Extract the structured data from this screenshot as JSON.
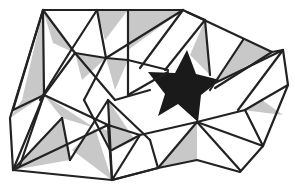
{
  "figure": {
    "title": "",
    "colors": {
      "background": "#ffffff",
      "edge": "#222222",
      "shaded": "#c8c8c8",
      "star": "#1a1a1a"
    },
    "outline": [
      [
        43,
        10
      ],
      [
        128,
        10
      ],
      [
        183,
        10
      ],
      [
        187,
        12
      ],
      [
        272,
        52
      ],
      [
        283,
        50
      ],
      [
        288,
        85
      ],
      [
        263,
        146
      ],
      [
        240,
        172
      ],
      [
        197,
        160
      ],
      [
        158,
        168
      ],
      [
        112,
        180
      ],
      [
        13,
        170
      ],
      [
        10,
        118
      ],
      [
        43,
        10
      ]
    ],
    "shaded_triangles": [
      [
        [
          43,
          10
        ],
        [
          53,
          43
        ],
        [
          75,
          53
        ]
      ],
      [
        [
          43,
          10
        ],
        [
          22,
          100
        ],
        [
          44,
          95
        ]
      ],
      [
        [
          97,
          10
        ],
        [
          128,
          10
        ],
        [
          105,
          40
        ]
      ],
      [
        [
          128,
          10
        ],
        [
          183,
          10
        ],
        [
          128,
          50
        ]
      ],
      [
        [
          75,
          53
        ],
        [
          106,
          58
        ],
        [
          82,
          80
        ]
      ],
      [
        [
          44,
          95
        ],
        [
          22,
          100
        ],
        [
          10,
          118
        ]
      ],
      [
        [
          44,
          95
        ],
        [
          95,
          128
        ],
        [
          62,
          118
        ]
      ],
      [
        [
          62,
          118
        ],
        [
          13,
          170
        ],
        [
          70,
          160
        ]
      ],
      [
        [
          95,
          128
        ],
        [
          112,
          180
        ],
        [
          72,
          150
        ]
      ],
      [
        [
          108,
          100
        ],
        [
          110,
          150
        ],
        [
          135,
          140
        ]
      ],
      [
        [
          128,
          60
        ],
        [
          106,
          58
        ],
        [
          115,
          90
        ]
      ],
      [
        [
          205,
          20
        ],
        [
          210,
          75
        ],
        [
          190,
          55
        ]
      ],
      [
        [
          243,
          40
        ],
        [
          272,
          52
        ],
        [
          215,
          83
        ]
      ],
      [
        [
          243,
          110
        ],
        [
          262,
          100
        ],
        [
          283,
          115
        ]
      ],
      [
        [
          197,
          122
        ],
        [
          158,
          168
        ],
        [
          197,
          160
        ]
      ],
      [
        [
          100,
          128
        ],
        [
          135,
          140
        ],
        [
          112,
          150
        ]
      ]
    ],
    "edges": [
      [
        [
          43,
          10
        ],
        [
          13,
          110
        ]
      ],
      [
        [
          43,
          10
        ],
        [
          75,
          53
        ]
      ],
      [
        [
          43,
          10
        ],
        [
          44,
          95
        ]
      ],
      [
        [
          97,
          10
        ],
        [
          68,
          55
        ]
      ],
      [
        [
          97,
          10
        ],
        [
          106,
          58
        ]
      ],
      [
        [
          128,
          10
        ],
        [
          128,
          95
        ]
      ],
      [
        [
          183,
          10
        ],
        [
          106,
          58
        ]
      ],
      [
        [
          183,
          10
        ],
        [
          140,
          68
        ]
      ],
      [
        [
          187,
          12
        ],
        [
          205,
          20
        ]
      ],
      [
        [
          205,
          20
        ],
        [
          210,
          75
        ]
      ],
      [
        [
          205,
          20
        ],
        [
          165,
          70
        ]
      ],
      [
        [
          243,
          40
        ],
        [
          210,
          90
        ]
      ],
      [
        [
          272,
          52
        ],
        [
          215,
          88
        ]
      ],
      [
        [
          283,
          50
        ],
        [
          238,
          110
        ]
      ],
      [
        [
          75,
          53
        ],
        [
          106,
          58
        ]
      ],
      [
        [
          106,
          58
        ],
        [
          128,
          60
        ]
      ],
      [
        [
          75,
          53
        ],
        [
          44,
          95
        ]
      ],
      [
        [
          68,
          55
        ],
        [
          40,
          100
        ]
      ],
      [
        [
          75,
          53
        ],
        [
          115,
          100
        ]
      ],
      [
        [
          106,
          58
        ],
        [
          84,
          100
        ]
      ],
      [
        [
          128,
          60
        ],
        [
          168,
          70
        ]
      ],
      [
        [
          44,
          95
        ],
        [
          108,
          125
        ]
      ],
      [
        [
          44,
          95
        ],
        [
          13,
          170
        ]
      ],
      [
        [
          44,
          95
        ],
        [
          20,
          165
        ]
      ],
      [
        [
          13,
          110
        ],
        [
          44,
          95
        ]
      ],
      [
        [
          62,
          118
        ],
        [
          70,
          160
        ]
      ],
      [
        [
          62,
          118
        ],
        [
          13,
          170
        ]
      ],
      [
        [
          84,
          100
        ],
        [
          110,
          150
        ]
      ],
      [
        [
          108,
          100
        ],
        [
          112,
          180
        ]
      ],
      [
        [
          108,
          125
        ],
        [
          112,
          180
        ]
      ],
      [
        [
          13,
          170
        ],
        [
          108,
          125
        ]
      ],
      [
        [
          70,
          160
        ],
        [
          108,
          100
        ]
      ],
      [
        [
          112,
          150
        ],
        [
          140,
          135
        ]
      ],
      [
        [
          108,
          100
        ],
        [
          150,
          140
        ]
      ],
      [
        [
          140,
          135
        ],
        [
          197,
          122
        ]
      ],
      [
        [
          112,
          180
        ],
        [
          158,
          168
        ]
      ],
      [
        [
          158,
          168
        ],
        [
          197,
          122
        ]
      ],
      [
        [
          197,
          122
        ],
        [
          245,
          110
        ]
      ],
      [
        [
          197,
          122
        ],
        [
          240,
          170
        ]
      ],
      [
        [
          197,
          122
        ],
        [
          263,
          146
        ]
      ],
      [
        [
          215,
          83
        ],
        [
          283,
          50
        ]
      ],
      [
        [
          245,
          110
        ],
        [
          263,
          146
        ]
      ],
      [
        [
          245,
          110
        ],
        [
          262,
          100
        ]
      ],
      [
        [
          262,
          100
        ],
        [
          288,
          85
        ]
      ],
      [
        [
          112,
          180
        ],
        [
          140,
          135
        ]
      ],
      [
        [
          108,
          125
        ],
        [
          140,
          135
        ]
      ],
      [
        [
          158,
          168
        ],
        [
          150,
          140
        ]
      ],
      [
        [
          128,
          95
        ],
        [
          168,
          72
        ]
      ],
      [
        [
          115,
          100
        ],
        [
          150,
          90
        ]
      ]
    ],
    "star": [
      [
        187,
        50
      ],
      [
        196,
        74
      ],
      [
        220,
        80
      ],
      [
        201,
        95
      ],
      [
        198,
        122
      ],
      [
        178,
        104
      ],
      [
        158,
        116
      ],
      [
        165,
        94
      ],
      [
        148,
        72
      ],
      [
        175,
        73
      ]
    ]
  }
}
